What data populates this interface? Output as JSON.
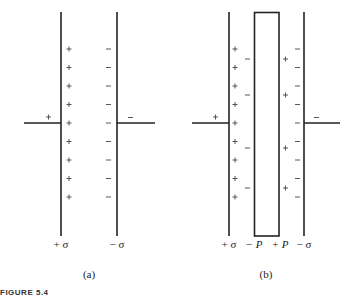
{
  "diagram": {
    "panel_a": {
      "caption": "(a)",
      "left_plate_label": "+ σ",
      "right_plate_label": "− σ",
      "left_plate_charges": [
        "+",
        "+",
        "+",
        "+",
        "+",
        "+",
        "+",
        "+",
        "+",
        "+",
        "+"
      ],
      "right_plate_charges": [
        "−",
        "−",
        "−",
        "−",
        "−",
        "−",
        "−",
        "−",
        "−",
        "−",
        "−"
      ],
      "left_lead_sign": "+",
      "right_lead_sign": "−"
    },
    "panel_b": {
      "caption": "(b)",
      "left_plate_label": "+ σ",
      "dielectric_left_label": "− P",
      "dielectric_right_label": "+ P",
      "right_plate_label": "− σ",
      "left_plate_charges": [
        "+",
        "+",
        "+",
        "+",
        "+",
        "+",
        "+",
        "+",
        "+",
        "+",
        "+"
      ],
      "right_plate_charges": [
        "−",
        "−",
        "−",
        "−",
        "−",
        "−",
        "−",
        "−",
        "−",
        "−",
        "−"
      ],
      "dielectric_left_charges": [
        "−",
        "−",
        "−",
        "−",
        "−"
      ],
      "dielectric_right_charges": [
        "+",
        "+",
        "+",
        "+",
        "+"
      ],
      "left_lead_sign": "+",
      "right_lead_sign": "−"
    },
    "figure_strip": "FIGURE 5.4"
  },
  "colors": {
    "line": "#222222",
    "text": "#222222",
    "background": "#ffffff"
  }
}
